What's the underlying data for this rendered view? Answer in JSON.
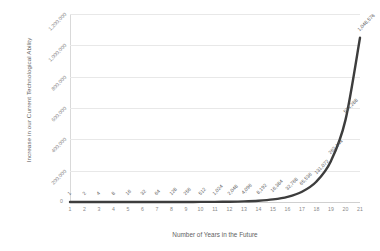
{
  "chart_data": {
    "type": "line",
    "title": "",
    "xlabel": "Number of Years in the Future",
    "ylabel": "Increase in our Current Technological Ability",
    "x": [
      1,
      2,
      3,
      4,
      5,
      6,
      7,
      8,
      9,
      10,
      11,
      12,
      13,
      14,
      15,
      16,
      17,
      18,
      19,
      20,
      21
    ],
    "values": [
      1,
      2,
      4,
      8,
      16,
      32,
      64,
      128,
      256,
      512,
      1024,
      2048,
      4096,
      8192,
      16384,
      32768,
      65536,
      131072,
      262144,
      524288,
      1048576
    ],
    "point_labels": [
      "1",
      "2",
      "4",
      "8",
      "16",
      "32",
      "64",
      "128",
      "256",
      "512",
      "1,024",
      "2,048",
      "4,096",
      "8,192",
      "16,384",
      "32,768",
      "65,536",
      "131,072",
      "262,144",
      "524,288",
      "1,048,576"
    ],
    "x_tick_labels": [
      "1",
      "2",
      "3",
      "4",
      "5",
      "6",
      "7",
      "8",
      "9",
      "10",
      "11",
      "12",
      "13",
      "14",
      "15",
      "16",
      "17",
      "18",
      "19",
      "20",
      "21"
    ],
    "y_tick_labels": [
      "200,000",
      "400,000",
      "600,000",
      "800,000",
      "1,000,000",
      "1,200,000"
    ],
    "y_tick_values": [
      200000,
      400000,
      600000,
      800000,
      1000000,
      1200000
    ],
    "y_origin_label": "0",
    "xlim": [
      1,
      21
    ],
    "ylim": [
      0,
      1200000
    ],
    "grid": true,
    "legend": "none",
    "series_color": "#3d3d3d",
    "grid_color": "#e8e8e8",
    "label_color": "#5a5a5a",
    "tick_color": "#8a8a8a",
    "background": "#ffffff"
  }
}
